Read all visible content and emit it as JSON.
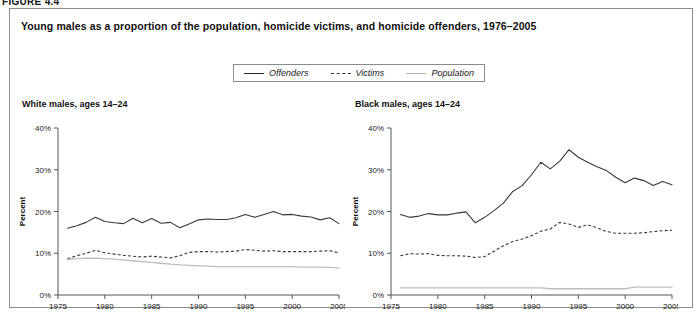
{
  "figure_label": "FIGURE 4.4",
  "title": "Young males as a proportion of the population, homicide victims, and homicide offenders, 1976–2005",
  "legend": {
    "items": [
      {
        "label": "Offenders",
        "style": "solid",
        "color": "#3a3a3a"
      },
      {
        "label": "Victims",
        "style": "dashed",
        "color": "#3a3a3a"
      },
      {
        "label": "Population",
        "style": "light",
        "color": "#bdbdbd"
      }
    ]
  },
  "panels": {
    "left": {
      "title": "White males, ages 14–24"
    },
    "right": {
      "title": "Black males, ages 14–24"
    }
  },
  "chart_data": [
    {
      "type": "line",
      "title": "White males, ages 14–24",
      "xlabel": "",
      "ylabel": "Percent",
      "xlim": [
        1975,
        2005
      ],
      "ylim": [
        0,
        40
      ],
      "xticks": [
        1975,
        1980,
        1985,
        1990,
        1995,
        2000,
        2005
      ],
      "yticks": [
        0,
        10,
        20,
        30,
        40
      ],
      "ytick_labels": [
        "0%",
        "10%",
        "20%",
        "30%",
        "40%"
      ],
      "xtick_labels": [
        "1975",
        "1980",
        "1985",
        "1990",
        "1995",
        "2000",
        "2005"
      ],
      "grid": false,
      "legend_position": "top-center-outside",
      "x": [
        1976,
        1977,
        1978,
        1979,
        1980,
        1981,
        1982,
        1983,
        1984,
        1985,
        1986,
        1987,
        1988,
        1989,
        1990,
        1991,
        1992,
        1993,
        1994,
        1995,
        1996,
        1997,
        1998,
        1999,
        2000,
        2001,
        2002,
        2003,
        2004,
        2005
      ],
      "series": [
        {
          "name": "Offenders",
          "style": "solid",
          "values": [
            16.0,
            16.6,
            17.4,
            18.6,
            17.6,
            17.3,
            17.1,
            18.4,
            17.3,
            18.3,
            17.2,
            17.4,
            16.1,
            17.0,
            18.0,
            18.2,
            18.1,
            18.1,
            18.5,
            19.3,
            18.6,
            19.3,
            20.0,
            19.2,
            19.3,
            18.9,
            18.7,
            18.0,
            18.5,
            17.1
          ]
        },
        {
          "name": "Victims",
          "style": "dashed",
          "values": [
            8.7,
            9.4,
            10.0,
            10.7,
            10.1,
            9.8,
            9.5,
            9.3,
            9.1,
            9.3,
            9.1,
            8.9,
            9.4,
            10.2,
            10.4,
            10.4,
            10.3,
            10.4,
            10.5,
            10.9,
            10.7,
            10.5,
            10.6,
            10.4,
            10.4,
            10.4,
            10.4,
            10.5,
            10.6,
            10.1
          ]
        },
        {
          "name": "Population",
          "style": "light",
          "values": [
            8.5,
            8.7,
            8.8,
            8.8,
            8.7,
            8.6,
            8.4,
            8.2,
            8.0,
            7.8,
            7.6,
            7.4,
            7.2,
            7.1,
            7.0,
            6.9,
            6.8,
            6.8,
            6.8,
            6.8,
            6.8,
            6.8,
            6.8,
            6.8,
            6.8,
            6.7,
            6.7,
            6.7,
            6.6,
            6.5
          ]
        }
      ]
    },
    {
      "type": "line",
      "title": "Black males, ages 14–24",
      "xlabel": "",
      "ylabel": "Percent",
      "xlim": [
        1975,
        2005
      ],
      "ylim": [
        0,
        40
      ],
      "xticks": [
        1975,
        1980,
        1985,
        1990,
        1995,
        2000,
        2005
      ],
      "yticks": [
        0,
        10,
        20,
        30,
        40
      ],
      "ytick_labels": [
        "0%",
        "10%",
        "20%",
        "30%",
        "40%"
      ],
      "xtick_labels": [
        "1975",
        "1980",
        "1985",
        "1990",
        "1995",
        "2000",
        "2005"
      ],
      "grid": false,
      "legend_position": "top-center-outside",
      "x": [
        1976,
        1977,
        1978,
        1979,
        1980,
        1981,
        1982,
        1983,
        1984,
        1985,
        1986,
        1987,
        1988,
        1989,
        1990,
        1991,
        1992,
        1993,
        1994,
        1995,
        1996,
        1997,
        1998,
        1999,
        2000,
        2001,
        2002,
        2003,
        2004,
        2005
      ],
      "series": [
        {
          "name": "Offenders",
          "style": "solid",
          "values": [
            19.3,
            18.6,
            18.9,
            19.5,
            19.2,
            19.2,
            19.6,
            19.9,
            17.3,
            18.6,
            20.2,
            22.0,
            24.8,
            26.2,
            28.8,
            31.8,
            30.2,
            32.0,
            34.8,
            33.0,
            31.8,
            30.7,
            29.8,
            28.2,
            26.9,
            28.0,
            27.4,
            26.2,
            27.2,
            26.4
          ]
        },
        {
          "name": "Victims",
          "style": "dashed",
          "values": [
            9.4,
            9.9,
            9.8,
            9.9,
            9.5,
            9.4,
            9.4,
            9.3,
            9.0,
            9.2,
            10.5,
            11.8,
            12.8,
            13.4,
            14.2,
            15.3,
            15.8,
            17.4,
            17.0,
            16.2,
            16.8,
            16.1,
            15.2,
            14.8,
            14.8,
            14.8,
            14.9,
            15.2,
            15.4,
            15.5
          ]
        },
        {
          "name": "Population",
          "style": "light",
          "values": [
            1.7,
            1.7,
            1.7,
            1.7,
            1.7,
            1.7,
            1.7,
            1.7,
            1.7,
            1.7,
            1.7,
            1.7,
            1.7,
            1.7,
            1.7,
            1.7,
            1.5,
            1.5,
            1.5,
            1.5,
            1.5,
            1.5,
            1.5,
            1.5,
            1.5,
            1.9,
            1.9,
            1.9,
            1.9,
            1.9
          ]
        }
      ]
    }
  ]
}
